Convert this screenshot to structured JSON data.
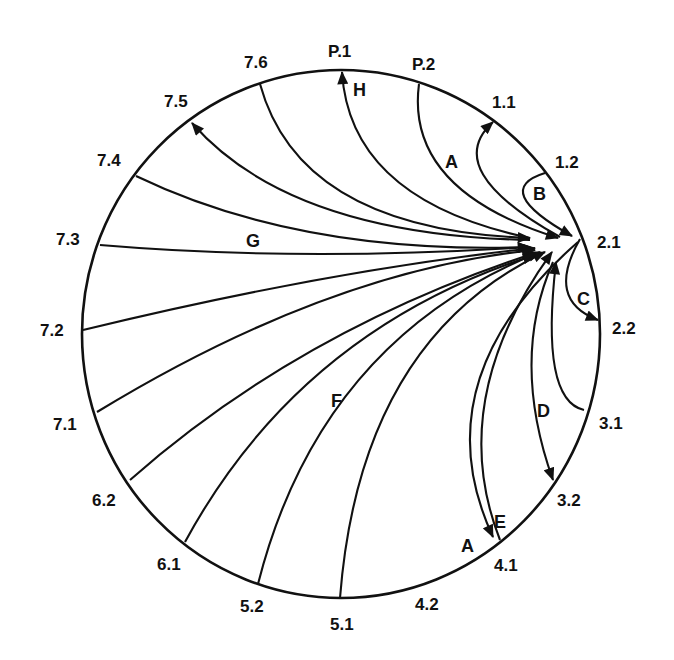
{
  "diagram": {
    "type": "circular-flow-diagram",
    "circle": {
      "cx": 341,
      "cy": 334,
      "rx": 259,
      "ry": 264
    },
    "hub": {
      "id": "2.1",
      "x": 580,
      "y": 239
    },
    "nodes": [
      {
        "id": "P.1",
        "label": "P.1",
        "x": 342,
        "y": 70,
        "lx": 328,
        "ly": 57
      },
      {
        "id": "P.2",
        "label": "P.2",
        "x": 419,
        "y": 84,
        "lx": 412,
        "ly": 70
      },
      {
        "id": "1.1",
        "label": "1.1",
        "x": 493,
        "y": 122,
        "lx": 492,
        "ly": 108
      },
      {
        "id": "1.2",
        "label": "1.2",
        "x": 545,
        "y": 173,
        "lx": 555,
        "ly": 168
      },
      {
        "id": "2.1",
        "label": "2.1",
        "x": 580,
        "y": 239,
        "lx": 597,
        "ly": 248
      },
      {
        "id": "2.2",
        "label": "2.2",
        "x": 598,
        "y": 320,
        "lx": 612,
        "ly": 334
      },
      {
        "id": "3.1",
        "label": "3.1",
        "x": 584,
        "y": 410,
        "lx": 599,
        "ly": 429
      },
      {
        "id": "3.2",
        "label": "3.2",
        "x": 553,
        "y": 480,
        "lx": 557,
        "ly": 506
      },
      {
        "id": "4.1",
        "label": "4.1",
        "x": 500,
        "y": 540,
        "lx": 494,
        "ly": 571
      },
      {
        "id": "4.2",
        "label": "4.2",
        "x": 420,
        "y": 583,
        "lx": 415,
        "ly": 610
      },
      {
        "id": "5.1",
        "label": "5.1",
        "x": 340,
        "y": 598,
        "lx": 330,
        "ly": 630
      },
      {
        "id": "5.2",
        "label": "5.2",
        "x": 258,
        "y": 584,
        "lx": 240,
        "ly": 612
      },
      {
        "id": "6.1",
        "label": "6.1",
        "x": 185,
        "y": 542,
        "lx": 157,
        "ly": 570
      },
      {
        "id": "6.2",
        "label": "6.2",
        "x": 130,
        "y": 480,
        "lx": 92,
        "ly": 506
      },
      {
        "id": "7.1",
        "label": "7.1",
        "x": 97,
        "y": 412,
        "lx": 53,
        "ly": 430
      },
      {
        "id": "7.2",
        "label": "7.2",
        "x": 83,
        "y": 330,
        "lx": 40,
        "ly": 336
      },
      {
        "id": "7.3",
        "label": "7.3",
        "x": 100,
        "y": 245,
        "lx": 56,
        "ly": 245
      },
      {
        "id": "7.4",
        "label": "7.4",
        "x": 136,
        "y": 176,
        "lx": 97,
        "ly": 166
      },
      {
        "id": "7.5",
        "label": "7.5",
        "x": 192,
        "y": 123,
        "lx": 164,
        "ly": 107
      },
      {
        "id": "7.6",
        "label": "7.6",
        "x": 260,
        "y": 84,
        "lx": 244,
        "ly": 68
      }
    ],
    "edges": [
      {
        "from": "7.3",
        "to": "2.1",
        "arrow": "end",
        "d": "M100,245 Q300,262 530,247"
      },
      {
        "from": "7.4",
        "to": "2.1",
        "arrow": "end",
        "d": "M136,176 Q300,255 530,247"
      },
      {
        "from": "2.1",
        "to": "7.5",
        "arrow": "start",
        "d": "M192,123 Q290,235 530,240"
      },
      {
        "from": "7.6",
        "to": "2.1",
        "arrow": "end",
        "d": "M260,84 Q300,230 530,238"
      },
      {
        "from": "2.1",
        "to": "P.1",
        "arrow": "start",
        "d": "M342,72 Q350,200 530,238"
      },
      {
        "from": "P.2",
        "to": "2.1",
        "arrow": "end",
        "d": "M419,84 Q405,190 558,238"
      },
      {
        "from": "2.1",
        "to": "1.1",
        "arrow": "start",
        "d": "M493,122 Q440,170 560,237"
      },
      {
        "from": "1.2",
        "to": "2.1",
        "arrow": "end",
        "d": "M545,173 Q490,190 572,236"
      },
      {
        "from": "2.1",
        "to": "2.2",
        "arrow": "end",
        "d": "M580,239 Q545,300 598,320"
      },
      {
        "from": "3.1",
        "to": "2.1",
        "arrow": "end",
        "d": "M584,410 Q540,400 556,262"
      },
      {
        "from": "2.1",
        "to": "3.2",
        "arrow": "end",
        "d": "M553,262 Q510,360 553,480"
      },
      {
        "from": "4.1",
        "to": "2.1",
        "arrow": "end",
        "d": "M500,540 Q445,400 552,252"
      },
      {
        "from": "2.1",
        "to": "4.1",
        "arrow": "end",
        "d": "M578,242 Q420,380 493,537"
      },
      {
        "from": "5.1",
        "to": "2.1",
        "arrow": "end",
        "d": "M340,598 Q360,340 545,252"
      },
      {
        "from": "2.1",
        "to": "5.2",
        "arrow": "end",
        "d": "M258,584 Q320,340 540,252"
      },
      {
        "from": "2.1",
        "to": "6.1",
        "arrow": "end",
        "d": "M185,542 Q300,330 535,255"
      },
      {
        "from": "2.1",
        "to": "6.2",
        "arrow": "end",
        "d": "M130,480 Q300,330 535,253"
      },
      {
        "from": "7.1",
        "to": "2.1",
        "arrow": "end",
        "d": "M97,412 Q330,270 535,250"
      },
      {
        "from": "7.2",
        "to": "2.1",
        "arrow": "end",
        "d": "M83,330 Q330,270 535,248"
      }
    ],
    "flow_labels": [
      {
        "id": "A1",
        "text": "A",
        "x": 445,
        "y": 168
      },
      {
        "id": "B",
        "text": "B",
        "x": 533,
        "y": 200
      },
      {
        "id": "C",
        "text": "C",
        "x": 577,
        "y": 305
      },
      {
        "id": "D",
        "text": "D",
        "x": 537,
        "y": 417
      },
      {
        "id": "E",
        "text": "E",
        "x": 494,
        "y": 528
      },
      {
        "id": "A2",
        "text": "A",
        "x": 461,
        "y": 552
      },
      {
        "id": "F",
        "text": "F",
        "x": 331,
        "y": 407
      },
      {
        "id": "G",
        "text": "G",
        "x": 246,
        "y": 247
      },
      {
        "id": "H",
        "text": "H",
        "x": 353,
        "y": 96
      }
    ]
  }
}
